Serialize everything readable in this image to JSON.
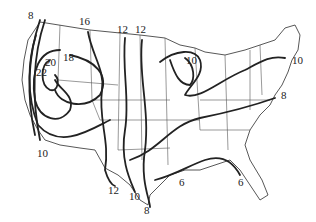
{
  "map": {
    "region": "Contiguous United States",
    "type": "isoline map",
    "isoline_labels": [
      {
        "value": "8",
        "x": 30,
        "y": 14
      },
      {
        "value": "16",
        "x": 81,
        "y": 20
      },
      {
        "value": "12",
        "x": 119,
        "y": 28
      },
      {
        "value": "12",
        "x": 137,
        "y": 28
      },
      {
        "value": "18",
        "x": 65,
        "y": 56
      },
      {
        "value": "20",
        "x": 47,
        "y": 61
      },
      {
        "value": "22",
        "x": 38,
        "y": 71
      },
      {
        "value": "10",
        "x": 187,
        "y": 59
      },
      {
        "value": "10",
        "x": 293,
        "y": 55
      },
      {
        "value": "8",
        "x": 281,
        "y": 92
      },
      {
        "value": "10",
        "x": 38,
        "y": 147
      },
      {
        "value": "12",
        "x": 108,
        "y": 187
      },
      {
        "value": "10",
        "x": 130,
        "y": 193
      },
      {
        "value": "8",
        "x": 145,
        "y": 208
      },
      {
        "value": "6",
        "x": 180,
        "y": 180
      },
      {
        "value": "6",
        "x": 238,
        "y": 179
      }
    ]
  }
}
